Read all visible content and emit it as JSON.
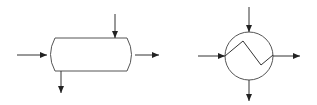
{
  "diagram": {
    "type": "process-flow-symbols",
    "colors": {
      "background": "#ffffff",
      "stroke": "#333333",
      "arrowhead": "#222222"
    },
    "symbols": [
      {
        "id": "horizontal-vessel",
        "shape": "capsule",
        "bounds": {
          "x": 47,
          "y": 38,
          "w": 88,
          "h": 33
        },
        "streams": [
          {
            "role": "inlet",
            "direction": "right",
            "from": [
              17,
              55
            ],
            "to": [
              47,
              55
            ]
          },
          {
            "role": "inlet",
            "direction": "down",
            "from": [
              115,
              14
            ],
            "to": [
              115,
              38
            ]
          },
          {
            "role": "outlet",
            "direction": "right",
            "from": [
              135,
              55
            ],
            "to": [
              159,
              55
            ]
          },
          {
            "role": "outlet",
            "direction": "down",
            "from": [
              61,
              71
            ],
            "to": [
              61,
              93
            ]
          }
        ]
      },
      {
        "id": "heat-exchanger",
        "shape": "circle-with-zigzag",
        "center": [
          249,
          56
        ],
        "radius": 24,
        "zigzag": [
          [
            225,
            56
          ],
          [
            243,
            41
          ],
          [
            261,
            65
          ],
          [
            273,
            55
          ]
        ],
        "streams": [
          {
            "role": "inlet",
            "direction": "down",
            "from": [
              249,
              7
            ],
            "to": [
              249,
              32
            ]
          },
          {
            "role": "inlet",
            "direction": "right",
            "from": [
              198,
              56
            ],
            "to": [
              225,
              56
            ]
          },
          {
            "role": "outlet",
            "direction": "right",
            "from": [
              273,
              56
            ],
            "to": [
              300,
              56
            ]
          },
          {
            "role": "outlet",
            "direction": "down",
            "from": [
              249,
              80
            ],
            "to": [
              249,
              101
            ]
          }
        ]
      }
    ]
  }
}
